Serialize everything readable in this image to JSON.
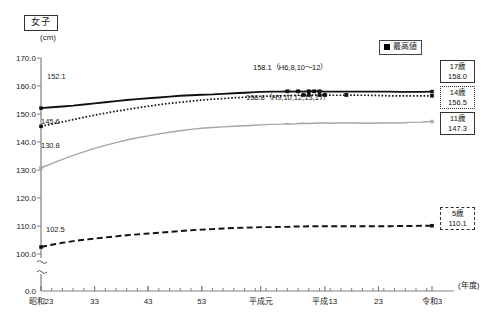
{
  "figure": {
    "sex_badge": "女子",
    "unit_label": "(cm)",
    "x_axis_unit": "(年度)"
  },
  "legend": {
    "marker_icon": "black-square-marker",
    "label": "最高値"
  },
  "annotations": {
    "top_peak": "158.1（H6,8,10〜12）",
    "second_peak": "156.8（H9,10,12,13,17）",
    "start_17": "152.1",
    "start_14": "145.6",
    "start_11": "130.8",
    "start_5": "102.5"
  },
  "end_labels": [
    {
      "age": "17歳",
      "value": "158.0",
      "style": "solid"
    },
    {
      "age": "14歳",
      "value": "156.5",
      "style": "dotted"
    },
    {
      "age": "11歳",
      "value": "147.3",
      "style": "gray"
    },
    {
      "age": "5歳",
      "value": "110.1",
      "style": "dashed"
    }
  ],
  "chart_data": {
    "type": "line",
    "title": "女子",
    "xlabel": "(年度)",
    "ylabel": "(cm)",
    "ylim": [
      100.0,
      170.0
    ],
    "y_break_at": 100.0,
    "y_zero_tick": "0.0",
    "yticks": [
      "170.0",
      "160.0",
      "150.0",
      "140.0",
      "130.0",
      "120.0",
      "110.0",
      "100.0",
      "0.0"
    ],
    "grid": false,
    "legend_position": "top-right",
    "xticks": [
      "昭和23",
      "33",
      "43",
      "53",
      "平成元",
      "平成13",
      "23",
      "令和3"
    ],
    "x_tick_years": [
      1948,
      1958,
      1968,
      1978,
      1989,
      2001,
      2011,
      2021
    ],
    "x_minor_tick_step_years": 2,
    "x": [
      1948,
      1950,
      1952,
      1954,
      1956,
      1958,
      1960,
      1962,
      1964,
      1966,
      1968,
      1970,
      1972,
      1974,
      1976,
      1978,
      1980,
      1982,
      1984,
      1986,
      1988,
      1989,
      1991,
      1993,
      1994,
      1995,
      1996,
      1997,
      1998,
      1999,
      2000,
      2001,
      2002,
      2003,
      2004,
      2005,
      2007,
      2009,
      2011,
      2013,
      2015,
      2017,
      2019,
      2021
    ],
    "series": [
      {
        "name": "17歳",
        "style": "solid-black",
        "start_value": 152.1,
        "end_value": 158.0,
        "peak_value": 158.1,
        "peak_label": "158.1（H6,8,10〜12）",
        "peak_years": [
          1994,
          1996,
          1998,
          1999,
          2000
        ],
        "values": [
          152.1,
          152.4,
          152.7,
          153.0,
          153.4,
          153.8,
          154.2,
          154.6,
          155.0,
          155.3,
          155.6,
          155.9,
          156.2,
          156.5,
          156.7,
          156.9,
          157.0,
          157.2,
          157.4,
          157.6,
          157.8,
          157.9,
          158.0,
          158.0,
          158.1,
          158.0,
          158.1,
          158.0,
          158.1,
          158.1,
          158.1,
          158.0,
          158.0,
          158.0,
          158.0,
          158.0,
          158.0,
          158.0,
          158.0,
          158.0,
          157.9,
          157.9,
          157.9,
          158.0
        ]
      },
      {
        "name": "14歳",
        "style": "dotted-black",
        "start_value": 145.6,
        "end_value": 156.5,
        "peak_value": 156.8,
        "peak_label": "156.8（H9,10,12,13,17）",
        "peak_years": [
          1997,
          1998,
          2000,
          2001,
          2005
        ],
        "values": [
          145.6,
          146.4,
          147.2,
          148.0,
          148.8,
          149.6,
          150.3,
          151.0,
          151.6,
          152.2,
          152.8,
          153.3,
          153.8,
          154.2,
          154.6,
          155.0,
          155.3,
          155.5,
          155.8,
          156.0,
          156.2,
          156.3,
          156.4,
          156.5,
          156.6,
          156.6,
          156.7,
          156.8,
          156.8,
          156.7,
          156.8,
          156.8,
          156.7,
          156.7,
          156.7,
          156.8,
          156.7,
          156.7,
          156.6,
          156.5,
          156.5,
          156.5,
          156.5,
          156.5
        ]
      },
      {
        "name": "11歳",
        "style": "solid-gray",
        "start_value": 130.8,
        "end_value": 147.3,
        "values": [
          130.8,
          132.3,
          133.8,
          135.2,
          136.5,
          137.7,
          138.8,
          139.8,
          140.7,
          141.5,
          142.2,
          142.9,
          143.5,
          144.0,
          144.5,
          144.9,
          145.2,
          145.4,
          145.6,
          145.8,
          146.0,
          146.1,
          146.3,
          146.4,
          146.5,
          146.4,
          146.6,
          146.7,
          146.6,
          146.7,
          146.8,
          146.8,
          146.7,
          146.8,
          146.8,
          146.8,
          146.8,
          146.7,
          146.8,
          146.8,
          146.8,
          147.0,
          147.1,
          147.3
        ]
      },
      {
        "name": "5歳",
        "style": "dashed-black",
        "start_value": 102.5,
        "end_value": 110.1,
        "values": [
          102.5,
          103.3,
          104.0,
          104.6,
          105.1,
          105.5,
          105.9,
          106.3,
          106.7,
          107.0,
          107.3,
          107.6,
          107.9,
          108.2,
          108.5,
          108.7,
          108.9,
          109.1,
          109.3,
          109.4,
          109.5,
          109.6,
          109.6,
          109.7,
          109.7,
          109.8,
          109.8,
          109.8,
          109.9,
          109.9,
          109.9,
          109.9,
          109.9,
          109.9,
          109.9,
          109.9,
          109.9,
          109.9,
          109.9,
          109.9,
          110.0,
          110.0,
          110.1,
          110.1
        ]
      }
    ]
  }
}
